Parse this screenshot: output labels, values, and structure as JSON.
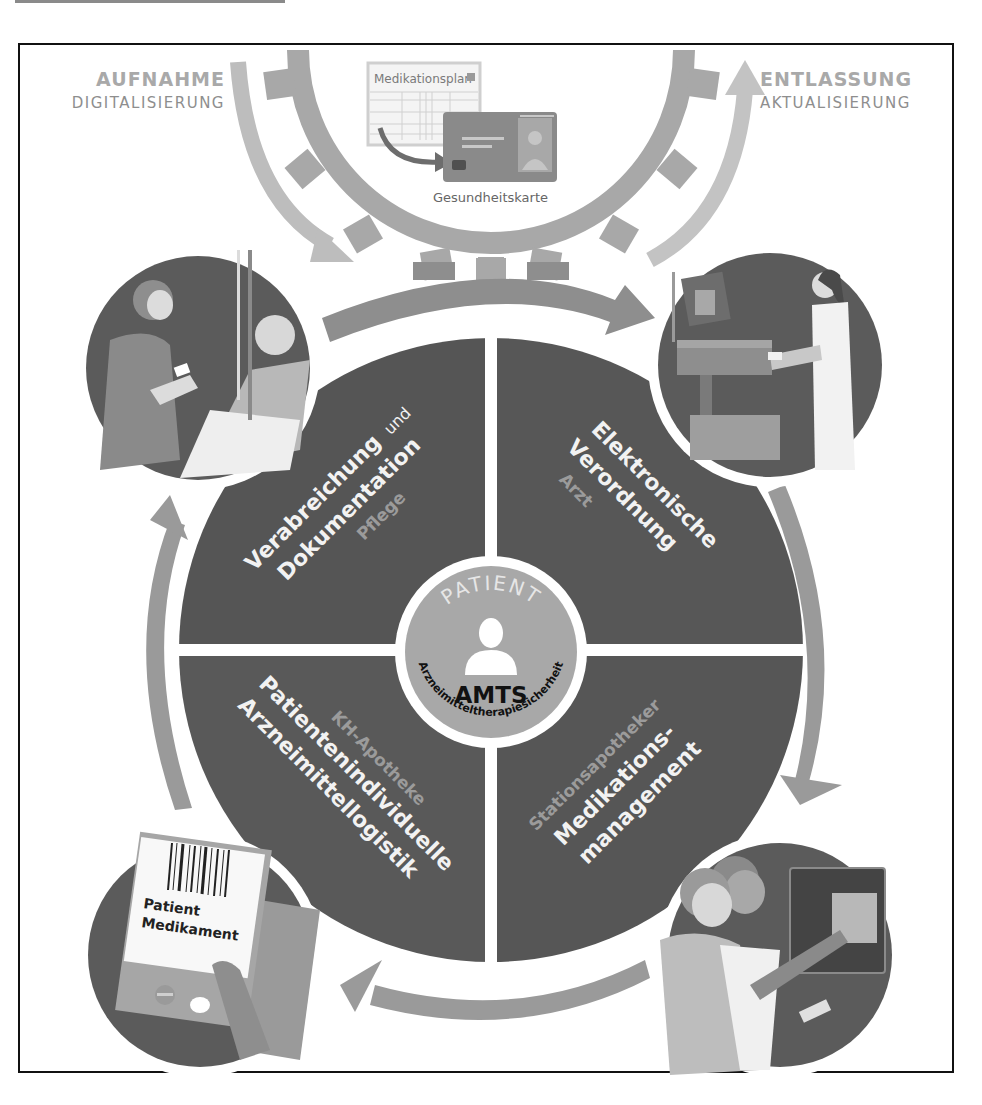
{
  "corners": {
    "left": {
      "title": "AUFNAHME",
      "subtitle": "DIGITALISIERUNG"
    },
    "right": {
      "title": "ENTLASSUNG",
      "subtitle": "AKTUALISIERUNG"
    }
  },
  "top_illustration": {
    "document_title": "Medikationsplan",
    "card_label": "Gesundheitskarte"
  },
  "quadrants": [
    {
      "position": "top-left",
      "title_line1": "Verabreichung",
      "title_connector": "und",
      "title_line2": "Dokumentation",
      "role": "Pflege"
    },
    {
      "position": "top-right",
      "title_line1": "Elektronische",
      "title_line2": "Verordnung",
      "role": "Arzt"
    },
    {
      "position": "bottom-left",
      "role": "KH-Apotheke",
      "title_line1": "Patientenindividuelle",
      "title_line2": "Arzneimittellogistik"
    },
    {
      "position": "bottom-right",
      "role": "Stationsapotheker",
      "title_line1": "Medikations-",
      "title_line2": "management"
    }
  ],
  "center": {
    "top_arc": "PATIENT",
    "title": "AMTS",
    "bottom_arc": "Arzneimitteltherapiesicherheit"
  },
  "barcode_label": {
    "line1": "Patient",
    "line2": "Medikament"
  },
  "colors": {
    "dark_segment": "#555555",
    "arrow_gray": "#9a9a9a",
    "light_arrow": "#bdbdbd",
    "center_disc": "#a8a8a8",
    "role_text": "#9b9b9b",
    "corner_text": "#a9a9a9"
  }
}
